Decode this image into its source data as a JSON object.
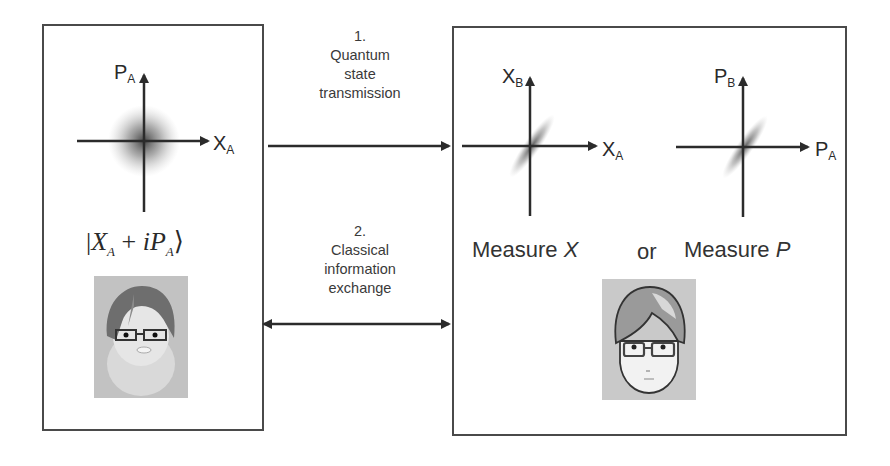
{
  "diagram": {
    "alice": {
      "axes": {
        "vertical_label": "P",
        "vertical_sub": "A",
        "horizontal_label": "X",
        "horizontal_sub": "A"
      },
      "state_ket": {
        "prefix": "|",
        "x": "X",
        "x_sub": "A",
        "plus": " + ",
        "i": "i",
        "p": "P",
        "p_sub": "A",
        "suffix": "⟩"
      },
      "avatar": "alice-avatar"
    },
    "bob": {
      "plot_x": {
        "vertical_label": "X",
        "vertical_sub": "B",
        "horizontal_label": "X",
        "horizontal_sub": "A"
      },
      "plot_p": {
        "vertical_label": "P",
        "vertical_sub": "B",
        "horizontal_label": "P",
        "horizontal_sub": "A"
      },
      "measure_x": {
        "word": "Measure ",
        "var": "X"
      },
      "or": "or",
      "measure_p": {
        "word": "Measure ",
        "var": "P"
      },
      "avatar": "bob-avatar"
    },
    "step1": {
      "number": "1.",
      "line1": "Quantum",
      "line2": "state",
      "line3": "transmission",
      "direction": "alice-to-bob"
    },
    "step2": {
      "number": "2.",
      "line1": "Classical",
      "line2": "information",
      "line3": "exchange",
      "direction": "bidirectional"
    },
    "colors": {
      "line": "#2b2b2b",
      "border": "#4a4a4a",
      "text": "#333333",
      "cloud": "#555555"
    }
  }
}
